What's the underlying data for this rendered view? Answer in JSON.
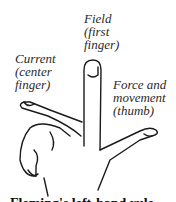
{
  "diagram": {
    "labels": {
      "field": [
        "Field",
        "(first",
        "finger)"
      ],
      "current": [
        "Current",
        "(center",
        "finger)"
      ],
      "force": [
        "Force and",
        "movement",
        "(thumb)"
      ]
    },
    "caption": "Fleming's left-hand rule"
  }
}
